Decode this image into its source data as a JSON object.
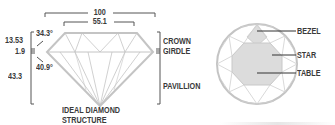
{
  "diagram": {
    "title_line1": "IDEAL DIAMOND",
    "title_line2": "STRUCTURE",
    "dimensions": {
      "total_width": "100",
      "table_width": "55.1",
      "crown_height": "13.53",
      "girdle_thickness": "1.9",
      "pavilion_depth": "43.3",
      "crown_angle": "34.3°",
      "pavilion_angle": "40.9°"
    },
    "side_labels": {
      "crown": "CROWN",
      "girdle": "GIRDLE",
      "pavilion": "PAVILLION"
    },
    "top_view_labels": {
      "bezel": "BEZEL",
      "star": "STAR",
      "table": "TABLE"
    },
    "colors": {
      "outline": "#bdbdbd",
      "facet_fill": "#dcdcdc",
      "text": "#3a3a3a",
      "bracket": "#555555"
    }
  }
}
